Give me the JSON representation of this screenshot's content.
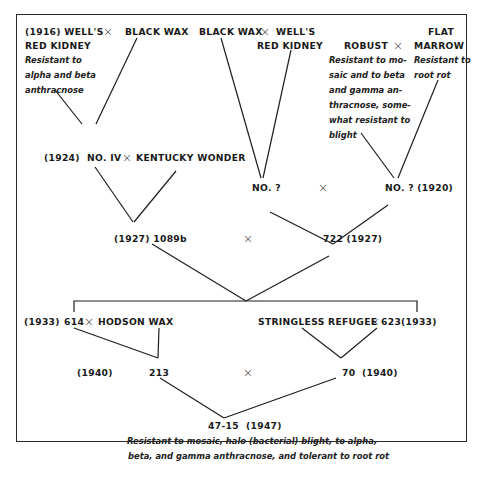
{
  "diagram": {
    "cross_symbol": "×",
    "generation_1": {
      "left_cross": {
        "parent_a": "(1916) WELL'S",
        "parent_a_line2": "RED KIDNEY",
        "parent_a_notes": [
          "Resistant to",
          "alpha and beta",
          "anthracnose"
        ],
        "parent_b": "BLACK WAX"
      },
      "middle_cross": {
        "parent_a": "BLACK WAX",
        "parent_b": "WELL'S",
        "parent_b_line2": "RED KIDNEY"
      },
      "right_cross": {
        "parent_a": "ROBUST",
        "parent_a_notes": [
          "Resistant to mo-",
          "saic and to beta",
          "and gamma an-",
          "thracnose, some-",
          "what resistant to",
          "blight"
        ],
        "parent_b_line1": "FLAT",
        "parent_b": "MARROW",
        "parent_b_notes": [
          "Resistant to",
          "root rot"
        ]
      }
    },
    "generation_2": {
      "left": {
        "year": "(1924)",
        "name": "NO. IV",
        "crossed_with": "KENTUCKY WONDER"
      },
      "middle": {
        "name": "NO. ?"
      },
      "right": {
        "name": "NO. ? (1920)"
      }
    },
    "generation_3": {
      "left": "(1927) 1089b",
      "right": "722 (1927)"
    },
    "generation_4": {
      "left": {
        "year": "(1933)",
        "name": "614",
        "crossed_with": "HODSON WAX"
      },
      "right": {
        "name": "STRINGLESS REFUGEE",
        "crossed_with": "623",
        "year": "(1933)"
      }
    },
    "generation_5": {
      "left_year": "(1940)",
      "left": "213",
      "right": "70",
      "right_year": "(1940)"
    },
    "result": {
      "name": "47-15",
      "year": "(1947)",
      "notes": [
        "Resistant to mosaic, halo (bacterial) blight, to alpha,",
        "beta, and gamma anthracnose, and tolerant to root rot"
      ]
    }
  }
}
